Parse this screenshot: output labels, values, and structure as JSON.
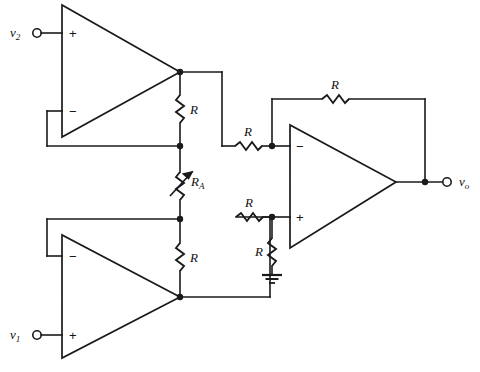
{
  "figure": {
    "type": "schematic",
    "width": 480,
    "height": 372,
    "line_color": "#1a1a1a",
    "background": "#ffffff"
  },
  "terminals": [
    {
      "id": "v2",
      "label": "v",
      "subscript": "2",
      "role": "input-terminal"
    },
    {
      "id": "v1",
      "label": "v",
      "subscript": "1",
      "role": "input-terminal"
    },
    {
      "id": "vo",
      "label": "v",
      "subscript": "o",
      "role": "output-terminal"
    }
  ],
  "opamps": [
    {
      "id": "A1",
      "position": "top-left",
      "plus_label": "+",
      "minus_label": "−",
      "plus_on": "top"
    },
    {
      "id": "A2",
      "position": "bottom-left",
      "plus_label": "+",
      "minus_label": "−",
      "plus_on": "bottom"
    },
    {
      "id": "A3",
      "position": "right",
      "plus_label": "+",
      "minus_label": "−",
      "plus_on": "bottom"
    }
  ],
  "resistors": [
    {
      "id": "R_top_bridge",
      "label": "R",
      "orientation": "vertical",
      "note": "between A1 output node and center node"
    },
    {
      "id": "R_A",
      "label": "R",
      "subscript": "A",
      "orientation": "vertical",
      "variable": true,
      "note": "gain setting variable resistor"
    },
    {
      "id": "R_bottom_bridge",
      "label": "R",
      "orientation": "vertical",
      "note": "between center node and A2 output node"
    },
    {
      "id": "R_inv_input",
      "label": "R",
      "orientation": "horizontal",
      "note": "series into inverting input of A3"
    },
    {
      "id": "R_feedback",
      "label": "R",
      "orientation": "horizontal",
      "note": "feedback around A3"
    },
    {
      "id": "R_nin_input",
      "label": "R",
      "orientation": "horizontal",
      "note": "series into non-inverting input of A3"
    },
    {
      "id": "R_gnd",
      "label": "R",
      "orientation": "vertical",
      "note": "from non-inverting input of A3 to ground"
    }
  ],
  "ground": {
    "id": "gnd1",
    "label": "",
    "symbol": "earth-ground"
  }
}
